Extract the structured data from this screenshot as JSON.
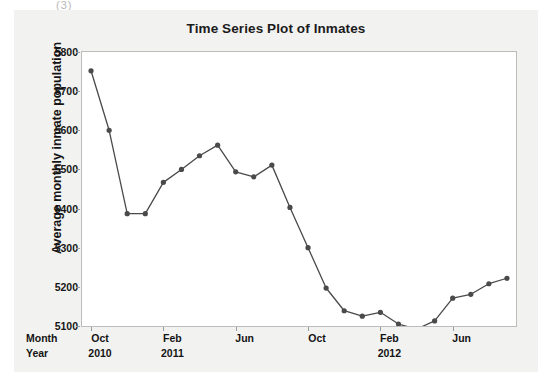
{
  "page": {
    "background_color": "#ffffff",
    "panel_color": "#f2f2f1",
    "scan_artifact": "(3)"
  },
  "chart_data": {
    "type": "line",
    "title": "Time Series Plot of Inmates",
    "xlabel": "",
    "ylabel": "Average monthly inmate population",
    "ylim": [
      5100,
      5800
    ],
    "y_ticks": [
      5100,
      5200,
      5300,
      5400,
      5500,
      5600,
      5700,
      5800
    ],
    "grid": false,
    "legend": null,
    "marker": "filled-circle",
    "line_color": "#4a4a4a",
    "marker_color": "#4a4a4a",
    "axis_rows": [
      {
        "name": "Month",
        "values": [
          "Oct",
          "Feb",
          "Jun",
          "Oct",
          "Feb",
          "Jun"
        ]
      },
      {
        "name": "Year",
        "values": [
          "2010",
          "2011",
          "",
          "",
          "2012",
          ""
        ]
      }
    ],
    "x_tick_indices": [
      0,
      4,
      8,
      12,
      16,
      20
    ],
    "categories": [
      "Oct 2010",
      "Nov 2010",
      "Dec 2010",
      "Jan 2011",
      "Feb 2011",
      "Mar 2011",
      "Apr 2011",
      "May 2011",
      "Jun 2011",
      "Jul 2011",
      "Aug 2011",
      "Sep 2011",
      "Oct 2011",
      "Nov 2011",
      "Dec 2011",
      "Jan 2012",
      "Feb 2012",
      "Mar 2012",
      "Apr 2012",
      "May 2012",
      "Jun 2012",
      "Jul 2012",
      "Aug 2012",
      "Sep 2012"
    ],
    "values": [
      5752,
      5600,
      5387,
      5387,
      5467,
      5500,
      5535,
      5562,
      5494,
      5481,
      5511,
      5403,
      5300,
      5197,
      5139,
      5125,
      5135,
      5105,
      5092,
      5113,
      5171,
      5181,
      5208,
      5222
    ],
    "series": [
      {
        "name": "Average monthly inmate population",
        "values": [
          5752,
          5600,
          5387,
          5387,
          5467,
          5500,
          5535,
          5562,
          5494,
          5481,
          5511,
          5403,
          5300,
          5197,
          5139,
          5125,
          5135,
          5105,
          5092,
          5113,
          5171,
          5181,
          5208,
          5222
        ]
      }
    ]
  }
}
